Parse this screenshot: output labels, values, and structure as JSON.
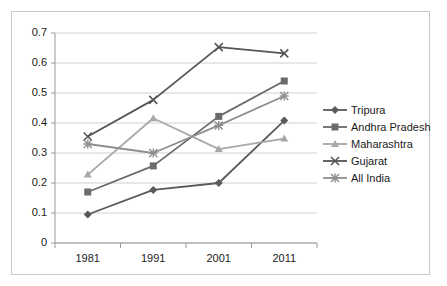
{
  "chart_data": {
    "type": "line",
    "title": "",
    "xlabel": "",
    "ylabel": "",
    "categories": [
      "1981",
      "1991",
      "2001",
      "2011"
    ],
    "x": [
      1981,
      1991,
      2001,
      2011
    ],
    "ylim": [
      0,
      0.7
    ],
    "yticks": [
      "0",
      "0.1",
      "0.2",
      "0.3",
      "0.4",
      "0.5",
      "0.6",
      "0.7"
    ],
    "ytick_values": [
      0,
      0.1,
      0.2,
      0.3,
      0.4,
      0.5,
      0.6,
      0.7
    ],
    "grid": true,
    "legend_position": "right",
    "series": [
      {
        "name": "Tripura",
        "values": [
          0.095,
          0.177,
          0.2,
          0.408
        ],
        "color": "#5a5a5a",
        "marker": "diamond"
      },
      {
        "name": "Andhra Pradesh",
        "values": [
          0.17,
          0.257,
          0.422,
          0.54
        ],
        "color": "#6b6b6b",
        "marker": "square"
      },
      {
        "name": "Maharashtra",
        "values": [
          0.228,
          0.416,
          0.313,
          0.348
        ],
        "color": "#a8a8a8",
        "marker": "triangle"
      },
      {
        "name": "Gujarat",
        "values": [
          0.355,
          0.477,
          0.653,
          0.632
        ],
        "color": "#555555",
        "marker": "cross"
      },
      {
        "name": "All India",
        "values": [
          0.33,
          0.3,
          0.392,
          0.49
        ],
        "color": "#8f8f8f",
        "marker": "star"
      }
    ]
  },
  "legend": {
    "items": [
      {
        "label": "Tripura"
      },
      {
        "label": "Andhra Pradesh"
      },
      {
        "label": "Maharashtra"
      },
      {
        "label": "Gujarat"
      },
      {
        "label": "All India"
      }
    ]
  },
  "axes": {
    "y_ticks": [
      "0.7",
      "0.6",
      "0.5",
      "0.4",
      "0.3",
      "0.2",
      "0.1",
      "0"
    ],
    "x_ticks": [
      "1981",
      "1991",
      "2001",
      "2011"
    ]
  }
}
